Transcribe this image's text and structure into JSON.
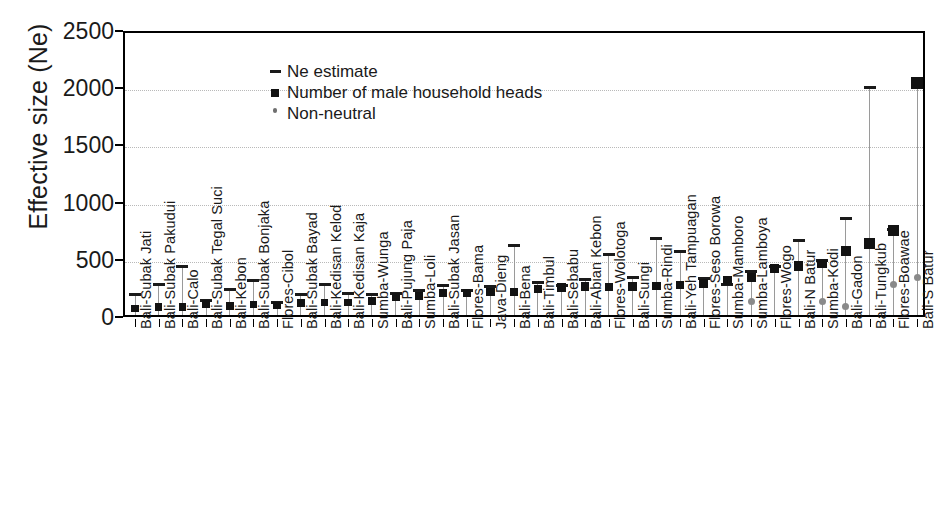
{
  "chart_data": {
    "type": "scatter",
    "title": "",
    "xlabel": "",
    "ylabel": "Effective size (Ne)",
    "ylim": [
      0,
      2500
    ],
    "yticks": [
      0,
      500,
      1000,
      1500,
      2000,
      2500
    ],
    "grid": true,
    "legend_position": "top-left",
    "legend": [
      {
        "key": "ne_estimate",
        "marker": "dash",
        "label": "Ne estimate"
      },
      {
        "key": "male_heads",
        "marker": "square",
        "label": "Number of male household heads"
      },
      {
        "key": "non_neutral",
        "marker": "dot",
        "label": "Non-neutral"
      }
    ],
    "categories": [
      "Bali-Subak Jati",
      "Bali-Subak Pakudui",
      "Bali-Calo",
      "Bali-Subak Tegal Suci",
      "Bali-Kebon",
      "Bali-Subak Bonjaka",
      "Flores-Cibol",
      "Bali-Subak Bayad",
      "Bali-Kedisan Kelod",
      "Bali-Kedisan Kaja",
      "Sumba-Wunga",
      "Bali-Pujung Paja",
      "Sumba-Loli",
      "Bali-Subak Jasan",
      "Flores-Bama",
      "Java-Dieng",
      "Bali-Bena",
      "Bali-Timbul",
      "Bali-Sebabu",
      "Bali-Abian Kebon",
      "Flores-Wolotoga",
      "Bali-Sungi",
      "Sumba-Rindi",
      "Bali-Yeh Tampuagan",
      "Flores-Seso Borowa",
      "Sumba-Mamboro",
      "Sumba-Lamboya",
      "Flores-Wogo",
      "Bali-N Batur",
      "Sumba-Kodi",
      "Bali-Gadon",
      "Bali-Tungkub",
      "Flores-Boawae",
      "Bali-S Batur"
    ],
    "series": [
      {
        "name": "Number of male household heads",
        "marker": "square",
        "values": [
          55,
          70,
          70,
          95,
          80,
          90,
          85,
          105,
          110,
          110,
          120,
          160,
          170,
          190,
          195,
          200,
          205,
          230,
          240,
          250,
          245,
          250,
          255,
          260,
          275,
          300,
          330,
          405,
          430,
          450,
          560,
          625,
          740,
          2030
        ]
      },
      {
        "name": "Ne estimate",
        "marker": "dash",
        "values": [
          175,
          270,
          420,
          130,
          225,
          300,
          110,
          180,
          265,
          190,
          175,
          185,
          215,
          260,
          215,
          245,
          610,
          280,
          255,
          310,
          530,
          330,
          670,
          555,
          320,
          265,
          380,
          420,
          650,
          480,
          840,
          1990,
          745,
          2030
        ]
      },
      {
        "name": "Non-neutral",
        "marker": "dot",
        "values": [
          null,
          null,
          null,
          null,
          null,
          null,
          null,
          null,
          null,
          null,
          null,
          null,
          null,
          null,
          null,
          null,
          null,
          null,
          null,
          null,
          null,
          null,
          null,
          null,
          null,
          null,
          120,
          null,
          null,
          120,
          75,
          null,
          265,
          325
        ]
      }
    ]
  }
}
